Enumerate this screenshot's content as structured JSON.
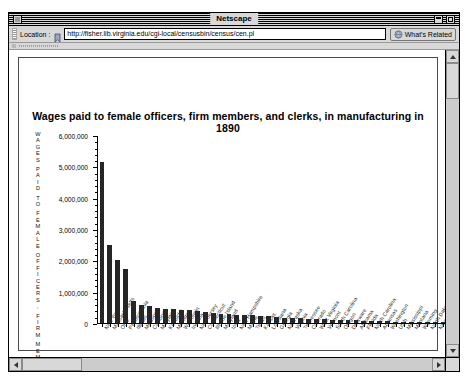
{
  "window": {
    "title": "Netscape",
    "close_icon": "close-box",
    "collapse_icon": "collapse-box",
    "zoom_icon": "zoom-box"
  },
  "toolbar": {
    "location_label": "Location :",
    "bookmark_icon": "bookmark-icon",
    "url": "http://fisher.lib.virginia.edu/cgi-local/censusbin/census/cen.pl",
    "url_placeholder": "Enter a URL",
    "whats_related_label": "What's Related",
    "globe_icon": "globe-icon"
  },
  "scrollbars": {
    "up_arrow_icon": "arrow-up-icon",
    "down_arrow_icon": "arrow-down-icon",
    "left_arrow_icon": "arrow-left-icon",
    "right_arrow_icon": "arrow-right-icon"
  },
  "chart_data": {
    "type": "bar",
    "title": "Wages paid to female officers, firm members, and clerks, in manufacturing in 1890",
    "xlabel": "NAME",
    "ylabel": "WAGES PAID TO FEMALE OFFICERS, FIRM MEMBERS",
    "ylabel_lines": [
      "W",
      "A",
      "G",
      "E",
      "S",
      "",
      "P",
      "A",
      "I",
      "D",
      "",
      "T",
      "O",
      "",
      "F",
      "E",
      "M",
      "A",
      "L",
      "E",
      "",
      "O",
      "F",
      "F",
      "I",
      "C",
      "E",
      "R",
      "S",
      ",",
      "",
      "F",
      "I",
      "R",
      "M",
      "",
      "M",
      "E",
      "M",
      "B",
      "E",
      "R",
      "S"
    ],
    "ylim": [
      0,
      6000000
    ],
    "ytick_values": [
      0,
      1000000,
      2000000,
      3000000,
      4000000,
      5000000,
      6000000
    ],
    "ytick_labels": [
      "0",
      "1,000,000",
      "2,000,000",
      "3,000,000",
      "4,000,000",
      "5,000,000",
      "6,000,000"
    ],
    "grid": false,
    "legend": false,
    "bar_color": "#262626",
    "categories": [
      "New York",
      "Massachusetts",
      "Ohio",
      "Pennsylvania",
      "Illinois",
      "Missouri",
      "California",
      "Maryland",
      "Kentucky",
      "Michigan",
      "Wisconsin",
      "Indiana",
      "New Jersey",
      "Connecticut",
      "Rhode Island",
      "Maryland",
      "Iowa",
      "New Hampshire",
      "Maine",
      "Texas",
      "Kansas",
      "Louisiana",
      "Georgia",
      "Nebraska",
      "Virginia",
      "Tennessee",
      "Colorado",
      "West Virginia",
      "Vermont",
      "South Carolina",
      "Oregon",
      "Delaware",
      "Alabama",
      "Florida",
      "North Carolina",
      "Arkansas",
      "Washington",
      "Utah",
      "Mississippi",
      "Montana",
      "Wyoming",
      "North Dakota",
      "Nevada",
      "South Dakota",
      "Idaho"
    ],
    "values": [
      5150000,
      2500000,
      2020000,
      1730000,
      700000,
      580000,
      540000,
      470000,
      450000,
      440000,
      430000,
      400000,
      390000,
      360000,
      330000,
      300000,
      280000,
      270000,
      260000,
      250000,
      230000,
      210000,
      190000,
      175000,
      160000,
      150000,
      140000,
      130000,
      120000,
      110000,
      100000,
      92000,
      85000,
      78000,
      70000,
      62000,
      55000,
      48000,
      42000,
      36000,
      30000,
      24000,
      18000,
      12000,
      8000
    ]
  }
}
